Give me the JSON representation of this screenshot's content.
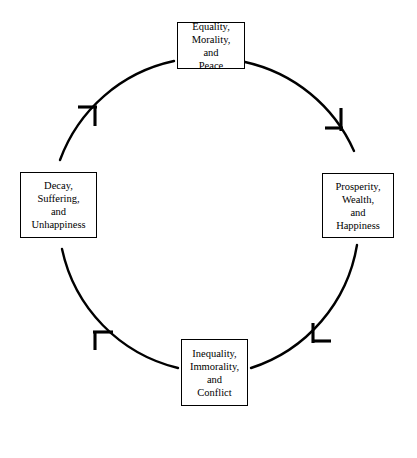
{
  "diagram": {
    "type": "cycle",
    "direction": "clockwise",
    "stroke_color": "#000000",
    "background_color": "#ffffff",
    "circle": {
      "center_x": 209,
      "center_y": 205,
      "radius": 156
    },
    "nodes": [
      {
        "id": "node-top",
        "position": "top",
        "lines": [
          "Equality,",
          "Morality,",
          "and",
          "Peace"
        ]
      },
      {
        "id": "node-right",
        "position": "right",
        "lines": [
          "Prosperity,",
          "Wealth,",
          "and",
          "Happiness"
        ]
      },
      {
        "id": "node-bottom",
        "position": "bottom",
        "lines": [
          "Inequality,",
          "Immorality,",
          "and",
          "Conflict"
        ]
      },
      {
        "id": "node-left",
        "position": "left",
        "lines": [
          "Decay,",
          "Suffering,",
          "and",
          "Unhappiness"
        ]
      }
    ],
    "arrows": [
      {
        "id": "arrow-top-right",
        "from": "node-top",
        "to": "node-right",
        "marker_angle_degrees": 45,
        "icon": "arrowhead-icon"
      },
      {
        "id": "arrow-right-bottom",
        "from": "node-right",
        "to": "node-bottom",
        "marker_angle_degrees": 135,
        "icon": "arrowhead-icon"
      },
      {
        "id": "arrow-bottom-left",
        "from": "node-bottom",
        "to": "node-left",
        "marker_angle_degrees": 225,
        "icon": "arrowhead-icon"
      },
      {
        "id": "arrow-left-top",
        "from": "node-left",
        "to": "node-top",
        "marker_angle_degrees": 315,
        "icon": "arrowhead-icon"
      }
    ]
  }
}
